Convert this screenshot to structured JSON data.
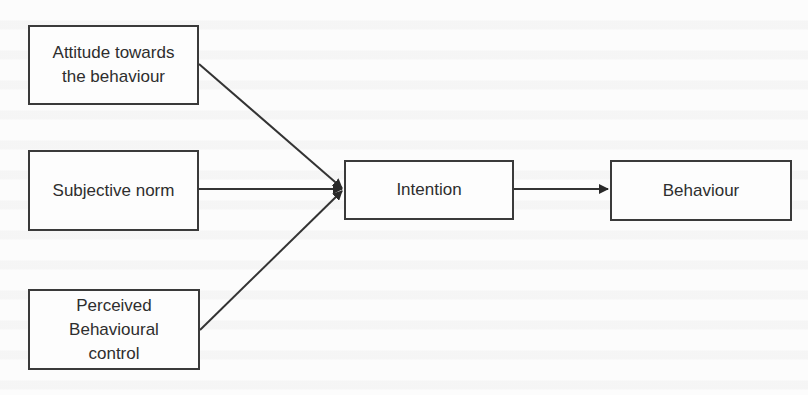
{
  "diagram": {
    "type": "flow",
    "title": "",
    "nodes": [
      {
        "id": "attitude",
        "label_lines": [
          "Attitude towards",
          "the behaviour"
        ]
      },
      {
        "id": "subjective_norm",
        "label_lines": [
          "Subjective norm"
        ]
      },
      {
        "id": "perceived_control",
        "label_lines": [
          "Perceived",
          "Behavioural",
          "control"
        ]
      },
      {
        "id": "intention",
        "label_lines": [
          "Intention"
        ]
      },
      {
        "id": "behaviour",
        "label_lines": [
          "Behaviour"
        ]
      }
    ],
    "edges": [
      {
        "from": "attitude",
        "to": "intention"
      },
      {
        "from": "subjective_norm",
        "to": "intention"
      },
      {
        "from": "perceived_control",
        "to": "intention"
      },
      {
        "from": "intention",
        "to": "behaviour"
      }
    ],
    "colors": {
      "stroke": "#3a3a3a",
      "text": "#2e2e2e",
      "background": "#fcfcfc"
    }
  }
}
